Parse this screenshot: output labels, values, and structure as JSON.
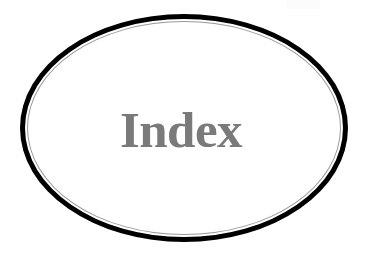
{
  "page": {
    "background_color": "#ffffff",
    "width": 369,
    "height": 253
  },
  "figure": {
    "type": "ellipse-label",
    "shape_name": "ellipse",
    "outer_stroke_color": "#000000",
    "outer_stroke_width_px": 5,
    "inner_stroke_color": "#9a9a9a",
    "inner_stroke_width_px": 1,
    "fill_color": "#ffffff",
    "center_x": 184,
    "center_y": 128,
    "radius_x": 164,
    "radius_y": 114,
    "label": "Index",
    "label_color": "#7a7a7a",
    "label_font_style": "bold-serif",
    "label_font_size_px": 51
  },
  "artifact": {
    "name": "scan-artifact",
    "color": "#fcfcfc"
  }
}
